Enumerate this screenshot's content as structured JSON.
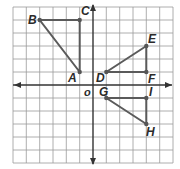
{
  "grid": {
    "cols": 12,
    "rows": 12,
    "origin_col": 6,
    "origin_row": 6,
    "line_color": "#9a9a9a",
    "axis_color": "#333333"
  },
  "origin_label": "O",
  "points": [
    {
      "name": "A",
      "x": -1,
      "y": 1
    },
    {
      "name": "B",
      "x": -4,
      "y": 5
    },
    {
      "name": "C",
      "x": -1,
      "y": 5
    },
    {
      "name": "D",
      "x": 1,
      "y": 1
    },
    {
      "name": "E",
      "x": 4,
      "y": 3
    },
    {
      "name": "F",
      "x": 4,
      "y": 1
    },
    {
      "name": "G",
      "x": 1,
      "y": -1
    },
    {
      "name": "H",
      "x": 4,
      "y": -3
    },
    {
      "name": "I",
      "x": 4,
      "y": -1
    }
  ],
  "triangles": [
    {
      "name": "triangle-ABC",
      "vertices": [
        "A",
        "B",
        "C"
      ]
    },
    {
      "name": "triangle-DEF",
      "vertices": [
        "D",
        "E",
        "F"
      ]
    },
    {
      "name": "triangle-GHI",
      "vertices": [
        "G",
        "H",
        "I"
      ]
    }
  ],
  "labels": {
    "A": "A",
    "B": "B",
    "C": "C",
    "D": "D",
    "E": "E",
    "F": "F",
    "G": "G",
    "H": "H",
    "I": "I"
  }
}
